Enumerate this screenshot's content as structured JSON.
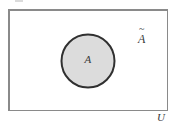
{
  "figure": {
    "kind": "venn-diagram",
    "canvas": {
      "width": 176,
      "height": 131,
      "background": "#ffffff"
    },
    "universe_rect": {
      "label": "U",
      "x": 8,
      "y": 9,
      "width": 160,
      "height": 102,
      "stroke": "#8a8a8a",
      "stroke_width": 1.5,
      "fill": "#ffffff"
    },
    "set_circle": {
      "label": "A",
      "cx": 88,
      "cy": 61,
      "r": 26.5,
      "stroke": "#303030",
      "stroke_width": 2,
      "fill": "#dcdcdc"
    },
    "complement_label": {
      "base": "A",
      "accent": "~",
      "full": "Ã"
    }
  }
}
